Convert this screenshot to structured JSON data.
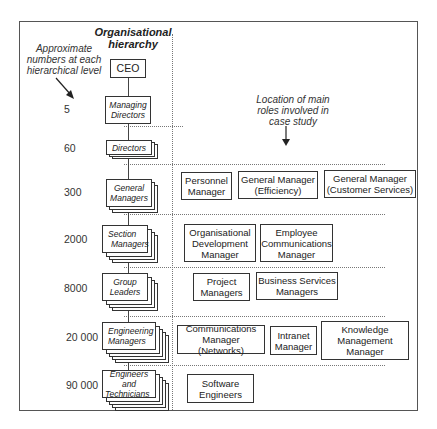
{
  "diagram": {
    "title": "Organisational hierarchy",
    "title_line1": "Organisational",
    "title_line2": "hierarchy",
    "left_note": {
      "line1": "Approximate",
      "line2": "numbers at each",
      "line3": "hierarchical level"
    },
    "right_note": {
      "line1": "Location of main",
      "line2": "roles involved in",
      "line3": "case study"
    },
    "levels": [
      {
        "label": "CEO",
        "count": ""
      },
      {
        "label_line1": "Managing",
        "label_line2": "Directors",
        "count": "5"
      },
      {
        "label": "Directors",
        "count": "60"
      },
      {
        "label_line1": "General",
        "label_line2": "Managers",
        "count": "300"
      },
      {
        "label_line1": "Section",
        "label_line2": "Managers",
        "count": "2000"
      },
      {
        "label_line1": "Group",
        "label_line2": "Leaders",
        "count": "8000"
      },
      {
        "label_line1": "Engineering",
        "label_line2": "Managers",
        "count": "20 000"
      },
      {
        "label_line1": "Engineers and",
        "label_line2": "Technicians",
        "count": "90 000"
      }
    ],
    "roles": {
      "general_managers": [
        {
          "line1": "Personnel",
          "line2": "Manager"
        },
        {
          "line1": "General Manager",
          "line2": "(Efficiency)"
        },
        {
          "line1": "General Manager",
          "line2": "(Customer Services)"
        }
      ],
      "section_managers": [
        {
          "line1": "Organisational",
          "line2": "Development",
          "line3": "Manager"
        },
        {
          "line1": "Employee",
          "line2": "Communications",
          "line3": "Manager"
        }
      ],
      "group_leaders": [
        {
          "line1": "Project",
          "line2": "Managers"
        },
        {
          "line1": "Business Services",
          "line2": "Managers"
        }
      ],
      "engineering_managers": [
        {
          "line1": "Communications",
          "line2": "Manager (Networks)"
        },
        {
          "line1": "Intranet",
          "line2": "Manager"
        },
        {
          "line1": "Knowledge",
          "line2": "Management",
          "line3": "Manager"
        }
      ],
      "engineers_technicians": [
        {
          "line1": "Software",
          "line2": "Engineers"
        }
      ]
    }
  }
}
